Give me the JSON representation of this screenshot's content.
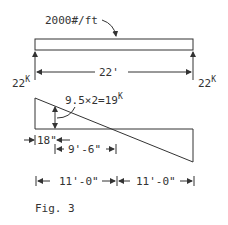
{
  "figure": {
    "caption": "Fig. 3",
    "load_label": "2000#/ft",
    "span_label": "22'",
    "left_reaction": {
      "value": "22",
      "unit": "K"
    },
    "right_reaction": {
      "value": "22",
      "unit": "K"
    },
    "shear_label": {
      "value": "9.5×2=19",
      "unit": "K"
    },
    "dim_18": "18\"",
    "dim_9_6": "9'-6\"",
    "dim_left_half": "11'-0\"",
    "dim_right_half": "11'-0\""
  }
}
